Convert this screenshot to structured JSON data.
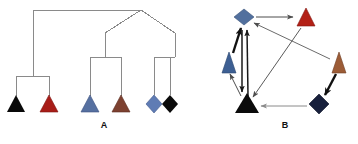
{
  "figure": {
    "width": 358,
    "height": 144,
    "background": "#ffffff"
  },
  "panels": [
    {
      "id": "A",
      "label": "A",
      "label_x": 104,
      "label_y": 128,
      "type": "phylogenetic-tree",
      "line_color": "#808080",
      "line_width": 1,
      "description": "Cladogram with six terminal taxa",
      "nodes": [
        {
          "name": "root",
          "x": 141,
          "y": 10
        },
        {
          "name": "internal-left",
          "x": 33,
          "y": 10
        },
        {
          "name": "clade-left-split",
          "x": 33,
          "y": 76
        },
        {
          "name": "internal-mid",
          "x": 105,
          "y": 33
        },
        {
          "name": "clade-mid-split",
          "x": 105,
          "y": 57
        },
        {
          "name": "internal-right",
          "x": 175,
          "y": 33
        },
        {
          "name": "clade-right-split",
          "x": 158,
          "y": 57
        }
      ],
      "edges": [
        {
          "from": "root",
          "to": "internal-left",
          "kind": "horizontal"
        },
        {
          "from": "internal-left",
          "to": "clade-left-split",
          "kind": "vertical"
        },
        {
          "from": "root",
          "to": "internal-mid",
          "kind": "diagonal"
        },
        {
          "from": "root",
          "to": "internal-right",
          "kind": "diagonal"
        },
        {
          "from": "internal-mid",
          "to": "clade-mid-split",
          "kind": "vertical"
        },
        {
          "from": "internal-right",
          "to": "clade-right-split",
          "kind": "vertical"
        }
      ],
      "leaves": [
        {
          "name": "taxon-1",
          "shape": "triangle",
          "color": "#090909",
          "x": 16,
          "y": 104,
          "stem_top": 76
        },
        {
          "name": "taxon-2",
          "shape": "triangle",
          "color": "#a81d18",
          "x": 49,
          "y": 104,
          "stem_top": 76
        },
        {
          "name": "taxon-3",
          "shape": "triangle",
          "color": "#5670a0",
          "x": 90,
          "y": 104,
          "stem_top": 57
        },
        {
          "name": "taxon-4",
          "shape": "triangle",
          "color": "#7d4130",
          "x": 121,
          "y": 104,
          "stem_top": 57
        },
        {
          "name": "taxon-5",
          "shape": "diamond",
          "color": "#5f7cb4",
          "x": 154,
          "y": 103,
          "stem_top": 57
        },
        {
          "name": "taxon-6",
          "shape": "diamond",
          "color": "#0a0a0a",
          "x": 170,
          "y": 103,
          "stem_top": 57
        }
      ]
    },
    {
      "id": "B",
      "label": "B",
      "label_x": 285,
      "label_y": 128,
      "type": "directed-network",
      "description": "Directed migration network between six populations",
      "nodes": [
        {
          "name": "node-blue-diamond-top",
          "shape": "diamond",
          "color": "#52709e",
          "x": 244,
          "y": 17,
          "size": 14
        },
        {
          "name": "node-red-triangle-top",
          "shape": "triangle",
          "color": "#b32016",
          "x": 306,
          "y": 17,
          "size": 15
        },
        {
          "name": "node-blue-triangle-left",
          "shape": "triangle",
          "color": "#3d5f93",
          "x": 229,
          "y": 62,
          "size": 14
        },
        {
          "name": "node-brown-triangle-right",
          "shape": "triangle",
          "color": "#9c5c36",
          "x": 339,
          "y": 62,
          "size": 14
        },
        {
          "name": "node-black-triangle-bottom",
          "shape": "triangle",
          "color": "#0b0b0b",
          "x": 247,
          "y": 105,
          "size": 17
        },
        {
          "name": "node-navy-diamond-bottom",
          "shape": "diamond",
          "color": "#18203c",
          "x": 319,
          "y": 104,
          "size": 14
        }
      ],
      "edges": [
        {
          "name": "edge-blue-diamond-to-red-triangle",
          "from": "node-blue-diamond-top",
          "to": "node-red-triangle-top",
          "weight": "thin",
          "color": "#4d4d4d"
        },
        {
          "name": "edge-blue-triangle-to-blue-diamond",
          "from": "node-blue-triangle-left",
          "to": "node-blue-diamond-top",
          "weight": "thick",
          "color": "#111111"
        },
        {
          "name": "edge-black-triangle-to-blue-diamond",
          "from": "node-black-triangle-bottom",
          "to": "node-blue-diamond-top",
          "weight": "medium",
          "color": "#1a1a1a"
        },
        {
          "name": "edge-blue-diamond-to-black-triangle",
          "from": "node-blue-diamond-top",
          "to": "node-black-triangle-bottom",
          "weight": "medium",
          "color": "#1a1a1a"
        },
        {
          "name": "edge-black-triangle-to-blue-triangle",
          "from": "node-black-triangle-bottom",
          "to": "node-blue-triangle-left",
          "weight": "thin",
          "color": "#4d4d4d"
        },
        {
          "name": "edge-brown-triangle-to-blue-diamond",
          "from": "node-brown-triangle-right",
          "to": "node-blue-diamond-top",
          "weight": "thin",
          "color": "#6b6b6b"
        },
        {
          "name": "edge-red-triangle-to-black-triangle",
          "from": "node-red-triangle-top",
          "to": "node-black-triangle-bottom",
          "weight": "thin",
          "color": "#5a5a5a"
        },
        {
          "name": "edge-brown-triangle-to-navy-diamond",
          "from": "node-brown-triangle-right",
          "to": "node-navy-diamond-bottom",
          "weight": "thick",
          "color": "#111111"
        },
        {
          "name": "edge-navy-diamond-to-black-triangle",
          "from": "node-navy-diamond-bottom",
          "to": "node-black-triangle-bottom",
          "weight": "thin",
          "color": "#8a8a8a"
        }
      ]
    }
  ]
}
